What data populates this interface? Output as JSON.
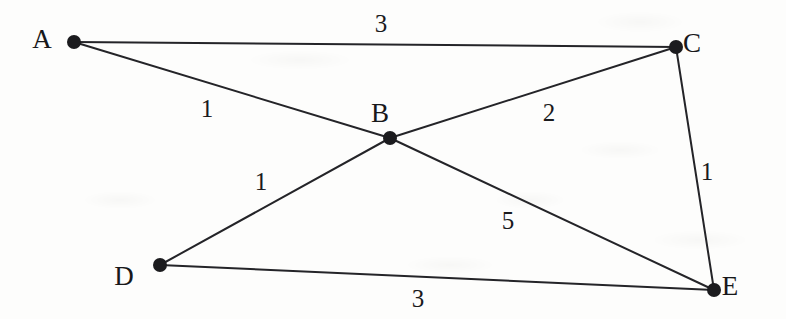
{
  "figure": {
    "kind": "weighted-undirected-graph",
    "title": "",
    "background_color": "#fdfdfc",
    "ink_color": "#1b1b1e",
    "edge_color": "#242428"
  },
  "nodes": [
    {
      "id": "A",
      "label": "A",
      "cx": 74,
      "cy": 42,
      "r": 7,
      "label_x": 42,
      "label_y": 48
    },
    {
      "id": "B",
      "label": "B",
      "cx": 390,
      "cy": 138,
      "r": 7,
      "label_x": 380,
      "label_y": 122
    },
    {
      "id": "C",
      "label": "C",
      "cx": 676,
      "cy": 47,
      "r": 7,
      "label_x": 692,
      "label_y": 52
    },
    {
      "id": "D",
      "label": "D",
      "cx": 160,
      "cy": 265,
      "r": 7,
      "label_x": 124,
      "label_y": 285
    },
    {
      "id": "E",
      "label": "E",
      "cx": 714,
      "cy": 290,
      "r": 7,
      "label_x": 730,
      "label_y": 295
    }
  ],
  "edges": [
    {
      "id": "A-C",
      "source": "A",
      "target": "C",
      "weight": "3",
      "label_x": 381,
      "label_y": 32
    },
    {
      "id": "A-B",
      "source": "A",
      "target": "B",
      "weight": "1",
      "label_x": 207,
      "label_y": 117
    },
    {
      "id": "B-C",
      "source": "B",
      "target": "C",
      "weight": "2",
      "label_x": 549,
      "label_y": 121
    },
    {
      "id": "B-D",
      "source": "B",
      "target": "D",
      "weight": "1",
      "label_x": 261,
      "label_y": 190
    },
    {
      "id": "B-E",
      "source": "B",
      "target": "E",
      "weight": "5",
      "label_x": 508,
      "label_y": 229
    },
    {
      "id": "C-E",
      "source": "C",
      "target": "E",
      "weight": "1",
      "label_x": 707,
      "label_y": 180
    },
    {
      "id": "D-E",
      "source": "D",
      "target": "E",
      "weight": "3",
      "label_x": 418,
      "label_y": 307
    }
  ],
  "chart_data": {
    "type": "table",
    "columns": [
      "edge",
      "weight"
    ],
    "rows": [
      [
        "A-C",
        3
      ],
      [
        "A-B",
        1
      ],
      [
        "B-C",
        2
      ],
      [
        "B-D",
        1
      ],
      [
        "B-E",
        5
      ],
      [
        "C-E",
        1
      ],
      [
        "D-E",
        3
      ]
    ],
    "vertices": [
      "A",
      "B",
      "C",
      "D",
      "E"
    ],
    "degrees": {
      "A": 2,
      "B": 4,
      "C": 3,
      "D": 2,
      "E": 3
    },
    "total_weight": 16,
    "grid": false,
    "legend": "none"
  }
}
